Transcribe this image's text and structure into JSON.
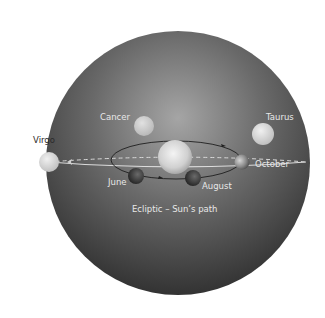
{
  "diagram": {
    "type": "celestial-sphere",
    "labels": {
      "virgo": "Virgo",
      "cancer": "Cancer",
      "taurus": "Taurus",
      "october": "October",
      "june": "June",
      "august": "August",
      "ecliptic": "Ecliptic – Sun’s path"
    },
    "colors": {
      "background": "#ffffff",
      "sphere_light": "#9a9a9a",
      "sphere_dark": "#2e2e2e",
      "ecliptic_line": "#d8d8d8",
      "label_light": "#e8e8e8",
      "label_dark": "#2a2a2a"
    }
  }
}
